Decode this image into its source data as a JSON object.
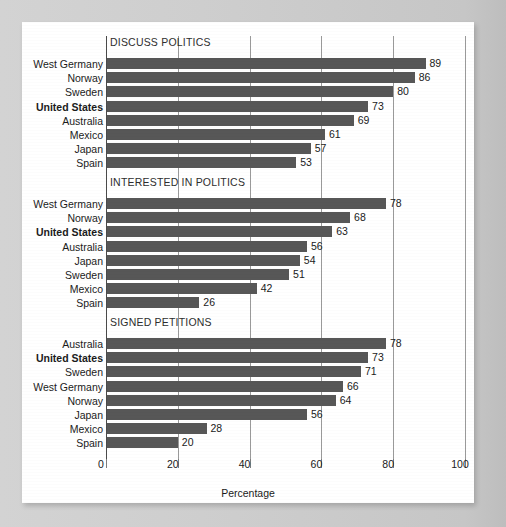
{
  "chart_data": {
    "type": "bar",
    "title": "",
    "xlabel": "Percentage",
    "ylabel": "",
    "xlim": [
      0,
      100
    ],
    "xticks": [
      0,
      20,
      40,
      60,
      80,
      100
    ],
    "xtick_labels": [
      "0",
      "20",
      "40",
      "60",
      "80",
      "100"
    ],
    "grid": true,
    "legend": "none",
    "orientation": "horizontal",
    "bar_color": "#575757",
    "highlight_category": "United States",
    "panels": [
      {
        "title": "DISCUSS POLITICS",
        "categories": [
          "West Germany",
          "Norway",
          "Sweden",
          "United States",
          "Australia",
          "Mexico",
          "Japan",
          "Spain"
        ],
        "values": [
          89,
          86,
          80,
          73,
          69,
          61,
          57,
          53
        ],
        "bold": [
          false,
          false,
          false,
          true,
          false,
          false,
          false,
          false
        ]
      },
      {
        "title": "INTERESTED IN POLITICS",
        "categories": [
          "West Germany",
          "Norway",
          "United States",
          "Australia",
          "Japan",
          "Sweden",
          "Mexico",
          "Spain"
        ],
        "values": [
          78,
          68,
          63,
          56,
          54,
          51,
          42,
          26
        ],
        "bold": [
          false,
          false,
          true,
          false,
          false,
          false,
          false,
          false
        ]
      },
      {
        "title": "SIGNED PETITIONS",
        "categories": [
          "Australia",
          "United States",
          "Sweden",
          "West Germany",
          "Norway",
          "Japan",
          "Mexico",
          "Spain"
        ],
        "values": [
          78,
          73,
          71,
          66,
          64,
          56,
          28,
          20
        ],
        "bold": [
          false,
          true,
          false,
          false,
          false,
          false,
          false,
          false
        ]
      }
    ]
  },
  "colors": {
    "bar": "#575757",
    "card": "#ffffff",
    "page_background": "#cfcfcf",
    "gridline": "#9a9a9a",
    "axis": "#4a4a4a",
    "text": "#1a1a1a"
  }
}
